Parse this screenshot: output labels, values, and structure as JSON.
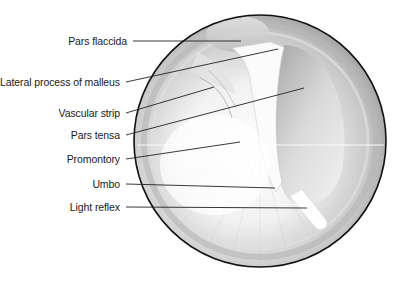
{
  "diagram": {
    "labels": [
      {
        "id": "pars-flaccida",
        "text": "Pars flaccida",
        "label_right_x": 127,
        "y": 41,
        "line": [
          133,
          41,
          241,
          41
        ]
      },
      {
        "id": "lateral-process-of-malleus",
        "text": "Lateral process of malleus",
        "label_right_x": 120,
        "y": 82,
        "line": [
          126,
          82,
          278,
          49
        ]
      },
      {
        "id": "vascular-strip",
        "text": "Vascular strip",
        "label_right_x": 120,
        "y": 113,
        "line": [
          126,
          113,
          214,
          87
        ]
      },
      {
        "id": "pars-tensa",
        "text": "Pars tensa",
        "label_right_x": 120,
        "y": 135,
        "line": [
          126,
          135,
          304,
          88
        ]
      },
      {
        "id": "promontory",
        "text": "Promontory",
        "label_right_x": 120,
        "y": 159,
        "line": [
          126,
          159,
          240,
          142
        ]
      },
      {
        "id": "umbo",
        "text": "Umbo",
        "label_right_x": 120,
        "y": 184,
        "line": [
          126,
          184,
          275,
          188
        ]
      },
      {
        "id": "light-reflex",
        "text": "Light reflex",
        "label_right_x": 120,
        "y": 207,
        "line": [
          126,
          207,
          307,
          208
        ]
      }
    ],
    "drum": {
      "cx": 260,
      "cy": 141,
      "r": 126
    },
    "colors": {
      "outline": "#111111",
      "leader": "#222222",
      "drum_light": "#f6f6f6",
      "drum_mid": "#c9c9c9",
      "drum_dark": "#8e8e8e"
    }
  }
}
